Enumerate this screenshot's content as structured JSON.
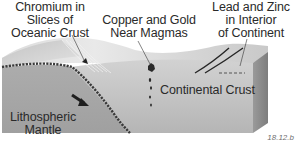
{
  "diagram": {
    "type": "geologic-block-diagram",
    "callouts": [
      {
        "id": "chromium",
        "lines": [
          "Chromium in",
          "Slices of",
          "Oceanic Crust"
        ]
      },
      {
        "id": "copper",
        "lines": [
          "Copper and Gold",
          "Near Magmas"
        ]
      },
      {
        "id": "lead",
        "lines": [
          "Lead and Zinc",
          "in Interior",
          "of Continent"
        ]
      }
    ],
    "regions": {
      "continental_crust": "Continental Crust",
      "mantle": [
        "Lithospheric",
        "Mantle"
      ]
    },
    "figure_label": "18.12.b",
    "colors": {
      "surface_light": "#e6e6e6",
      "surface_mid": "#cfcfcf",
      "crust_front": "#b8b8b8",
      "mantle_front": "#9f9f9f",
      "slab_edge": "#3a3a3a",
      "leader_line": "#333333",
      "text": "#2a2a2a"
    }
  }
}
